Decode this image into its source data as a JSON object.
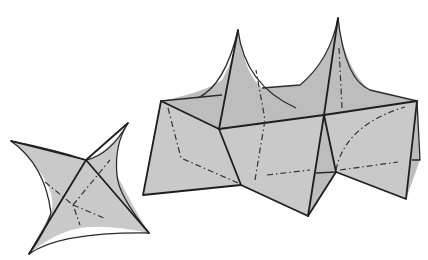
{
  "figure": {
    "colors": {
      "background": "#ffffff",
      "surface_fill": "#c9c9c9",
      "edge": "#1e1e1e",
      "hidden_line": "#333333"
    },
    "objects": [
      {
        "name": "four-pointed star surface",
        "position": "left"
      },
      {
        "name": "double-peaked folded panel structure",
        "position": "right"
      }
    ]
  }
}
